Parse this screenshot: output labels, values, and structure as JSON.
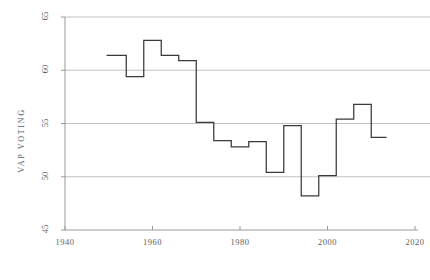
{
  "chart_data": {
    "type": "line",
    "title": "",
    "subtitle": "",
    "xlabel": "",
    "ylabel": "VAP VOTING",
    "xlim": [
      1936,
      2024
    ],
    "ylim": [
      45,
      65
    ],
    "xticks": [
      1940,
      1960,
      1980,
      2000,
      2020
    ],
    "yticks": [
      45,
      50,
      55,
      60,
      65
    ],
    "xtick_labels": [
      "1940",
      "1960",
      "1980",
      "2000",
      "2020"
    ],
    "ytick_labels": [
      "45",
      "50",
      "55",
      "60",
      "65"
    ],
    "grid": "horizontal",
    "legend": "none",
    "line_color": "#3a3a3a",
    "grid_color": "#b9b9b9",
    "axis_color": "#9a9a9a",
    "step_style": "post",
    "x": [
      1952,
      1956,
      1960,
      1964,
      1968,
      1972,
      1976,
      1980,
      1984,
      1988,
      1992,
      1996,
      2000,
      2004,
      2008,
      2012
    ],
    "values": [
      61.4,
      59.4,
      62.8,
      61.4,
      60.9,
      55.1,
      53.4,
      52.8,
      53.3,
      50.4,
      54.8,
      48.2,
      50.1,
      55.4,
      56.8,
      53.7
    ],
    "series": [
      {
        "name": "VAP VOTING",
        "values": [
          61.4,
          59.4,
          62.8,
          61.4,
          60.9,
          55.1,
          53.4,
          52.8,
          53.3,
          50.4,
          54.8,
          48.2,
          50.1,
          55.4,
          56.8,
          53.7
        ]
      }
    ]
  }
}
